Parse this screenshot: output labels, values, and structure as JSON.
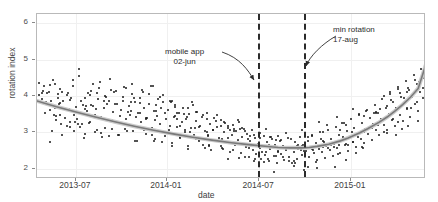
{
  "chart_data": {
    "type": "scatter",
    "title": "",
    "xlabel": "date",
    "ylabel": "rotation index",
    "x_tick_labels": [
      "2013-07",
      "2014-01",
      "2014-07",
      "2015-01"
    ],
    "y_tick_labels": [
      "2",
      "3",
      "4",
      "5",
      "6"
    ],
    "ylim": [
      1.75,
      6.25
    ],
    "xlim": [
      "2013-04",
      "2015-04"
    ],
    "grid": true,
    "legend": "none",
    "series": [
      {
        "name": "rotation index observations",
        "type": "scatter",
        "color": "#1a1a1a",
        "n_points": 430,
        "points": [
          [
            0.005,
            4.05
          ],
          [
            0.012,
            3.92
          ],
          [
            0.018,
            4.3
          ],
          [
            0.02,
            3.55
          ],
          [
            0.026,
            3.8
          ],
          [
            0.03,
            4.12
          ],
          [
            0.034,
            3.62
          ],
          [
            0.038,
            3.05
          ],
          [
            0.042,
            4.45
          ],
          [
            0.046,
            3.7
          ],
          [
            0.05,
            3.35
          ],
          [
            0.054,
            3.95
          ],
          [
            0.058,
            4.2
          ],
          [
            0.06,
            3.5
          ],
          [
            0.064,
            2.95
          ],
          [
            0.068,
            3.88
          ],
          [
            0.072,
            3.42
          ],
          [
            0.076,
            4.05
          ],
          [
            0.08,
            3.62
          ],
          [
            0.084,
            3.18
          ],
          [
            0.088,
            3.95
          ],
          [
            0.092,
            4.3
          ],
          [
            0.096,
            3.05
          ],
          [
            0.1,
            3.72
          ],
          [
            0.104,
            3.4
          ],
          [
            0.108,
            4.55
          ],
          [
            0.112,
            3.88
          ],
          [
            0.116,
            3.25
          ],
          [
            0.12,
            2.88
          ],
          [
            0.124,
            3.95
          ],
          [
            0.128,
            3.6
          ],
          [
            0.132,
            4.1
          ],
          [
            0.136,
            3.3
          ],
          [
            0.14,
            3.78
          ],
          [
            0.144,
            4.35
          ],
          [
            0.148,
            3.02
          ],
          [
            0.152,
            3.65
          ],
          [
            0.156,
            3.92
          ],
          [
            0.16,
            4.22
          ],
          [
            0.164,
            3.45
          ],
          [
            0.168,
            2.9
          ],
          [
            0.172,
            3.7
          ],
          [
            0.176,
            4.02
          ],
          [
            0.18,
            3.35
          ],
          [
            0.184,
            3.88
          ],
          [
            0.188,
            4.48
          ],
          [
            0.192,
            3.12
          ],
          [
            0.196,
            3.58
          ],
          [
            0.2,
            3.8
          ],
          [
            0.204,
            4.15
          ],
          [
            0.208,
            3.28
          ],
          [
            0.212,
            2.95
          ],
          [
            0.216,
            3.62
          ],
          [
            0.22,
            3.98
          ],
          [
            0.224,
            4.25
          ],
          [
            0.228,
            3.4
          ],
          [
            0.232,
            3.05
          ],
          [
            0.236,
            3.75
          ],
          [
            0.24,
            3.5
          ],
          [
            0.244,
            4.08
          ],
          [
            0.248,
            3.22
          ],
          [
            0.252,
            3.85
          ],
          [
            0.256,
            2.78
          ],
          [
            0.26,
            3.55
          ],
          [
            0.264,
            3.95
          ],
          [
            0.268,
            3.3
          ],
          [
            0.272,
            4.12
          ],
          [
            0.276,
            3.68
          ],
          [
            0.28,
            2.98
          ],
          [
            0.284,
            3.42
          ],
          [
            0.288,
            3.8
          ],
          [
            0.292,
            4.3
          ],
          [
            0.296,
            3.15
          ],
          [
            0.3,
            3.6
          ],
          [
            0.304,
            2.85
          ],
          [
            0.308,
            3.48
          ],
          [
            0.312,
            3.92
          ],
          [
            0.316,
            3.25
          ],
          [
            0.32,
            3.7
          ],
          [
            0.324,
            4.05
          ],
          [
            0.328,
            2.92
          ],
          [
            0.332,
            3.38
          ],
          [
            0.336,
            3.62
          ],
          [
            0.34,
            3.1
          ],
          [
            0.344,
            3.85
          ],
          [
            0.348,
            2.72
          ],
          [
            0.352,
            3.45
          ],
          [
            0.356,
            3.72
          ],
          [
            0.36,
            3.18
          ],
          [
            0.364,
            3.55
          ],
          [
            0.368,
            2.88
          ],
          [
            0.372,
            3.3
          ],
          [
            0.376,
            3.68
          ],
          [
            0.38,
            3.02
          ],
          [
            0.384,
            3.4
          ],
          [
            0.388,
            2.65
          ],
          [
            0.392,
            3.52
          ],
          [
            0.396,
            3.15
          ],
          [
            0.4,
            3.78
          ],
          [
            0.404,
            2.95
          ],
          [
            0.408,
            3.32
          ],
          [
            0.412,
            3.58
          ],
          [
            0.416,
            2.8
          ],
          [
            0.42,
            3.2
          ],
          [
            0.424,
            3.45
          ],
          [
            0.428,
            2.68
          ],
          [
            0.432,
            3.05
          ],
          [
            0.436,
            3.38
          ],
          [
            0.44,
            2.92
          ],
          [
            0.444,
            3.25
          ],
          [
            0.448,
            2.55
          ],
          [
            0.452,
            3.1
          ],
          [
            0.456,
            3.42
          ],
          [
            0.46,
            2.78
          ],
          [
            0.464,
            3.18
          ],
          [
            0.468,
            2.88
          ],
          [
            0.472,
            3.35
          ],
          [
            0.476,
            2.6
          ],
          [
            0.48,
            3.02
          ],
          [
            0.484,
            3.28
          ],
          [
            0.488,
            2.72
          ],
          [
            0.492,
            3.15
          ],
          [
            0.496,
            2.5
          ],
          [
            0.5,
            2.95
          ],
          [
            0.504,
            3.22
          ],
          [
            0.508,
            2.68
          ],
          [
            0.512,
            3.05
          ],
          [
            0.516,
            2.82
          ],
          [
            0.52,
            3.3
          ],
          [
            0.524,
            2.45
          ],
          [
            0.528,
            2.9
          ],
          [
            0.532,
            3.12
          ],
          [
            0.536,
            2.62
          ],
          [
            0.54,
            2.98
          ],
          [
            0.544,
            2.35
          ],
          [
            0.548,
            2.78
          ],
          [
            0.552,
            3.08
          ],
          [
            0.556,
            2.55
          ],
          [
            0.56,
            2.88
          ],
          [
            0.564,
            2.42
          ],
          [
            0.568,
            2.7
          ],
          [
            0.572,
            3.0
          ],
          [
            0.576,
            2.3
          ],
          [
            0.58,
            2.62
          ],
          [
            0.584,
            2.92
          ],
          [
            0.588,
            2.48
          ],
          [
            0.592,
            2.75
          ],
          [
            0.596,
            2.25
          ],
          [
            0.6,
            2.58
          ],
          [
            0.604,
            2.85
          ],
          [
            0.608,
            2.38
          ],
          [
            0.612,
            2.68
          ],
          [
            0.616,
            2.2
          ],
          [
            0.62,
            2.52
          ],
          [
            0.624,
            2.8
          ],
          [
            0.628,
            2.42
          ],
          [
            0.632,
            2.65
          ],
          [
            0.636,
            2.28
          ],
          [
            0.64,
            2.55
          ],
          [
            0.644,
            2.88
          ],
          [
            0.648,
            2.35
          ],
          [
            0.652,
            2.62
          ],
          [
            0.656,
            2.18
          ],
          [
            0.66,
            2.48
          ],
          [
            0.664,
            2.75
          ],
          [
            0.668,
            2.3
          ],
          [
            0.672,
            2.58
          ],
          [
            0.676,
            2.9
          ],
          [
            0.68,
            2.4
          ],
          [
            0.684,
            2.68
          ],
          [
            0.688,
            2.22
          ],
          [
            0.692,
            2.52
          ],
          [
            0.696,
            2.8
          ],
          [
            0.7,
            2.35
          ],
          [
            0.704,
            2.62
          ],
          [
            0.708,
            2.95
          ],
          [
            0.712,
            2.45
          ],
          [
            0.716,
            2.72
          ],
          [
            0.72,
            2.28
          ],
          [
            0.724,
            2.58
          ],
          [
            0.728,
            3.02
          ],
          [
            0.732,
            2.48
          ],
          [
            0.736,
            2.78
          ],
          [
            0.74,
            2.32
          ],
          [
            0.744,
            2.65
          ],
          [
            0.748,
            3.1
          ],
          [
            0.752,
            2.55
          ],
          [
            0.756,
            2.85
          ],
          [
            0.76,
            2.38
          ],
          [
            0.764,
            2.7
          ],
          [
            0.768,
            3.18
          ],
          [
            0.772,
            2.6
          ],
          [
            0.776,
            2.95
          ],
          [
            0.78,
            2.45
          ],
          [
            0.784,
            2.8
          ],
          [
            0.788,
            3.28
          ],
          [
            0.792,
            2.68
          ],
          [
            0.796,
            3.05
          ],
          [
            0.8,
            2.52
          ],
          [
            0.804,
            2.9
          ],
          [
            0.808,
            3.38
          ],
          [
            0.812,
            2.75
          ],
          [
            0.816,
            3.15
          ],
          [
            0.82,
            2.62
          ],
          [
            0.824,
            3.0
          ],
          [
            0.828,
            3.5
          ],
          [
            0.832,
            2.85
          ],
          [
            0.836,
            3.28
          ],
          [
            0.84,
            2.72
          ],
          [
            0.844,
            3.12
          ],
          [
            0.848,
            3.62
          ],
          [
            0.852,
            2.98
          ],
          [
            0.856,
            3.42
          ],
          [
            0.86,
            2.82
          ],
          [
            0.864,
            3.25
          ],
          [
            0.868,
            3.78
          ],
          [
            0.872,
            3.1
          ],
          [
            0.876,
            3.55
          ],
          [
            0.88,
            2.95
          ],
          [
            0.884,
            3.38
          ],
          [
            0.888,
            3.92
          ],
          [
            0.892,
            3.22
          ],
          [
            0.896,
            3.7
          ],
          [
            0.9,
            3.08
          ],
          [
            0.904,
            3.52
          ],
          [
            0.908,
            4.08
          ],
          [
            0.912,
            3.35
          ],
          [
            0.916,
            3.85
          ],
          [
            0.92,
            3.2
          ],
          [
            0.924,
            3.68
          ],
          [
            0.928,
            4.25
          ],
          [
            0.932,
            3.5
          ],
          [
            0.936,
            4.0
          ],
          [
            0.94,
            3.32
          ],
          [
            0.944,
            3.82
          ],
          [
            0.948,
            4.42
          ],
          [
            0.952,
            3.65
          ],
          [
            0.956,
            4.18
          ],
          [
            0.96,
            3.45
          ],
          [
            0.964,
            3.98
          ],
          [
            0.968,
            4.58
          ],
          [
            0.972,
            3.8
          ],
          [
            0.976,
            4.35
          ],
          [
            0.98,
            3.6
          ],
          [
            0.984,
            4.12
          ],
          [
            0.988,
            4.75
          ],
          [
            0.992,
            3.95
          ],
          [
            0.996,
            4.5
          ],
          [
            0.999,
            4.9
          ]
        ]
      },
      {
        "name": "fitted trend (loess)",
        "type": "line",
        "color": "#7a7a7a",
        "points": [
          [
            0.0,
            3.88
          ],
          [
            0.05,
            3.72
          ],
          [
            0.1,
            3.58
          ],
          [
            0.15,
            3.44
          ],
          [
            0.2,
            3.31
          ],
          [
            0.25,
            3.19
          ],
          [
            0.3,
            3.08
          ],
          [
            0.35,
            2.98
          ],
          [
            0.4,
            2.89
          ],
          [
            0.45,
            2.81
          ],
          [
            0.5,
            2.74
          ],
          [
            0.55,
            2.68
          ],
          [
            0.6,
            2.63
          ],
          [
            0.62,
            2.61
          ],
          [
            0.65,
            2.6
          ],
          [
            0.68,
            2.6
          ],
          [
            0.7,
            2.61
          ],
          [
            0.72,
            2.64
          ],
          [
            0.75,
            2.7
          ],
          [
            0.78,
            2.79
          ],
          [
            0.8,
            2.87
          ],
          [
            0.83,
            3.01
          ],
          [
            0.85,
            3.12
          ],
          [
            0.88,
            3.3
          ],
          [
            0.9,
            3.44
          ],
          [
            0.92,
            3.6
          ],
          [
            0.94,
            3.78
          ],
          [
            0.96,
            3.98
          ],
          [
            0.98,
            4.22
          ],
          [
            1.0,
            4.88
          ]
        ]
      }
    ],
    "annotations": [
      {
        "name": "mobile-app",
        "line1": "mobile app",
        "line2": "02-jun",
        "text_x": 0.5,
        "vline_x": 0.568,
        "vline_style": "dashed",
        "vline_color": "#2b2b2b"
      },
      {
        "name": "min-rotation",
        "line1": "min rotation",
        "line2": "17-aug",
        "text_x": 0.855,
        "vline_x": 0.686,
        "vline_style": "dashed",
        "vline_color": "#2b2b2b"
      }
    ]
  },
  "axis": {
    "x_title": "date",
    "y_title": "rotation index",
    "x_ticks": [
      {
        "label": "2013-07",
        "pos": 0.1
      },
      {
        "label": "2014-01",
        "pos": 0.334
      },
      {
        "label": "2014-07",
        "pos": 0.571
      },
      {
        "label": "2015-01",
        "pos": 0.807
      }
    ],
    "y_ticks": [
      {
        "label": "6",
        "pos": 0.055
      },
      {
        "label": "5",
        "pos": 0.276
      },
      {
        "label": "4",
        "pos": 0.497
      },
      {
        "label": "3",
        "pos": 0.718
      },
      {
        "label": "2",
        "pos": 0.939
      }
    ]
  },
  "annotation_labels": {
    "mobile_app_l1": "mobile app",
    "mobile_app_l2": "02-jun",
    "min_rotation_l1": "min rotation",
    "min_rotation_l2": "17-aug"
  },
  "colors": {
    "point": "#1a1a1a",
    "trend": "#7a7a7a",
    "vline": "#2b2b2b",
    "grid": "#f0f0f0",
    "frame": "#b9b9b9",
    "text": "#3d3d3d",
    "background": "#ffffff"
  }
}
